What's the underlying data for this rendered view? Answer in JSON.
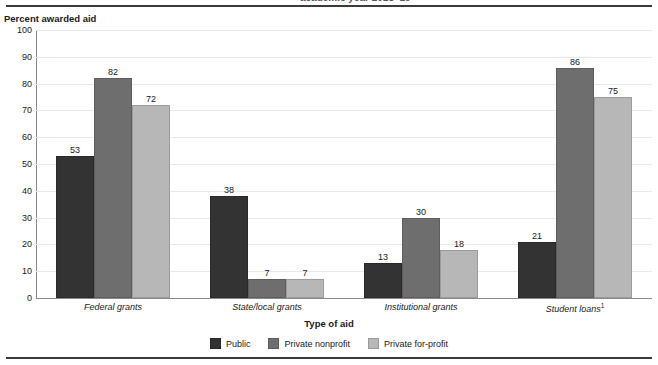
{
  "header": {
    "clipped_title_fragment": "academic year 2018–19"
  },
  "chart_data": {
    "type": "bar",
    "title": "",
    "ylabel": "Percent awarded aid",
    "xlabel": "Type of aid",
    "ylim": [
      0,
      100
    ],
    "ytick_step": 10,
    "yticks": [
      100,
      90,
      80,
      70,
      60,
      50,
      40,
      30,
      20,
      10,
      0
    ],
    "grid": true,
    "legend_position": "bottom-center",
    "categories": [
      "Federal grants",
      "State/local grants",
      "Institutional grants",
      "Student loans"
    ],
    "category_footnote_markers": [
      "",
      "",
      "",
      "1"
    ],
    "series": [
      {
        "name": "Public",
        "color": "#333333",
        "values": [
          53,
          38,
          13,
          21
        ]
      },
      {
        "name": "Private nonprofit",
        "color": "#6e6e6e",
        "values": [
          82,
          7,
          30,
          86
        ]
      },
      {
        "name": "Private for-profit",
        "color": "#b7b7b7",
        "values": [
          72,
          7,
          18,
          75
        ]
      }
    ]
  }
}
